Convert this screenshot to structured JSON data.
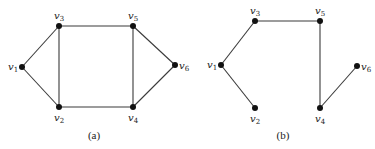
{
  "figure": {
    "graphs": [
      {
        "id": "a",
        "caption": "(a)",
        "caption_pos": [
          94,
          139
        ],
        "nodes": [
          {
            "id": "v1",
            "label": "v",
            "sub": "1",
            "x": 22,
            "y": 67,
            "lx": 8,
            "ly": 70
          },
          {
            "id": "v2",
            "label": "v",
            "sub": "2",
            "x": 59,
            "y": 107,
            "lx": 54,
            "ly": 121
          },
          {
            "id": "v3",
            "label": "v",
            "sub": "3",
            "x": 59,
            "y": 26,
            "lx": 54,
            "ly": 19
          },
          {
            "id": "v4",
            "label": "v",
            "sub": "4",
            "x": 133,
            "y": 107,
            "lx": 128,
            "ly": 121
          },
          {
            "id": "v5",
            "label": "v",
            "sub": "5",
            "x": 133,
            "y": 26,
            "lx": 128,
            "ly": 19
          },
          {
            "id": "v6",
            "label": "v",
            "sub": "6",
            "x": 175,
            "y": 65,
            "lx": 179,
            "ly": 69
          }
        ],
        "edges": [
          [
            "v1",
            "v3"
          ],
          [
            "v1",
            "v2"
          ],
          [
            "v3",
            "v5"
          ],
          [
            "v3",
            "v2"
          ],
          [
            "v5",
            "v4"
          ],
          [
            "v5",
            "v6"
          ],
          [
            "v6",
            "v4"
          ],
          [
            "v2",
            "v4"
          ]
        ]
      },
      {
        "id": "b",
        "caption": "(b)",
        "caption_pos": [
          283,
          139
        ],
        "nodes": [
          {
            "id": "v1",
            "label": "v",
            "sub": "1",
            "x": 221,
            "y": 65,
            "lx": 207,
            "ly": 68
          },
          {
            "id": "v2",
            "label": "v",
            "sub": "2",
            "x": 255,
            "y": 108,
            "lx": 250,
            "ly": 122
          },
          {
            "id": "v3",
            "label": "v",
            "sub": "3",
            "x": 255,
            "y": 21,
            "lx": 250,
            "ly": 14
          },
          {
            "id": "v4",
            "label": "v",
            "sub": "4",
            "x": 320,
            "y": 108,
            "lx": 315,
            "ly": 122
          },
          {
            "id": "v5",
            "label": "v",
            "sub": "5",
            "x": 320,
            "y": 21,
            "lx": 315,
            "ly": 14
          },
          {
            "id": "v6",
            "label": "v",
            "sub": "6",
            "x": 357,
            "y": 66,
            "lx": 361,
            "ly": 70
          }
        ],
        "edges": [
          [
            "v1",
            "v3"
          ],
          [
            "v1",
            "v2"
          ],
          [
            "v3",
            "v5"
          ],
          [
            "v5",
            "v4"
          ],
          [
            "v4",
            "v6"
          ]
        ]
      }
    ]
  }
}
